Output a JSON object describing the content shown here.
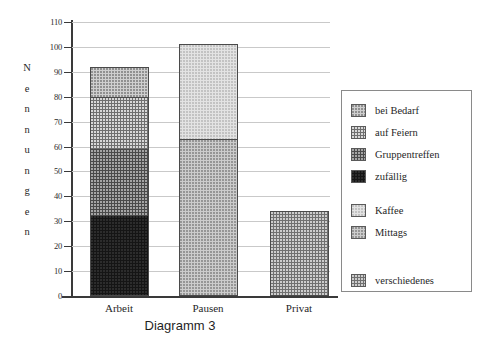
{
  "chart_data": {
    "type": "bar",
    "subtype": "stacked-bar",
    "title": "Diagramm 3",
    "xlabel": "",
    "ylabel": "Nennungen",
    "ylim": [
      0,
      110
    ],
    "ytick_step": 10,
    "yticks": [
      110,
      100,
      90,
      80,
      70,
      60,
      50,
      40,
      30,
      20,
      10,
      0
    ],
    "grid": true,
    "grid_orientation": "horizontal",
    "legend_position": "right",
    "categories": [
      "Arbeit",
      "Pausen",
      "Privat"
    ],
    "series": [
      {
        "name": "zufällig",
        "values": [
          32.5,
          0,
          0
        ],
        "color": "#151515"
      },
      {
        "name": "Gruppentreffen",
        "values": [
          26.5,
          0,
          0
        ],
        "color": "#4a4a4a"
      },
      {
        "name": "auf Feiern",
        "values": [
          21,
          0,
          0
        ],
        "color": "#6f6f6f"
      },
      {
        "name": "bei Bedarf",
        "values": [
          12,
          0,
          0
        ],
        "color": "#cfcfcf"
      },
      {
        "name": "Mittags",
        "values": [
          0,
          63,
          0
        ],
        "color": "#cccccc"
      },
      {
        "name": "Kaffee",
        "values": [
          0,
          38,
          0
        ],
        "color": "#e3e3e3"
      },
      {
        "name": "verschiedenes",
        "values": [
          0,
          0,
          34
        ],
        "color": "#707070"
      }
    ],
    "totals": [
      92,
      101,
      34
    ],
    "legend_groups": [
      {
        "entries": [
          {
            "label": "bei Bedarf",
            "pattern": "pat-bedarf"
          },
          {
            "label": "auf Feiern",
            "pattern": "pat-feiern"
          },
          {
            "label": "Gruppentreffen",
            "pattern": "pat-gruppen"
          },
          {
            "label": "zufällig",
            "pattern": "pat-zufaellig"
          }
        ]
      },
      {
        "entries": [
          {
            "label": "Kaffee",
            "pattern": "pat-kaffee"
          },
          {
            "label": "Mittags",
            "pattern": "pat-mittags"
          }
        ]
      },
      {
        "entries": [
          {
            "label": "verschiedenes",
            "pattern": "pat-verschiedenes"
          }
        ]
      }
    ]
  },
  "axis": {
    "y_title_letters": [
      "N",
      "e",
      "n",
      "n",
      "u",
      "n",
      "g",
      "e",
      "n"
    ]
  }
}
